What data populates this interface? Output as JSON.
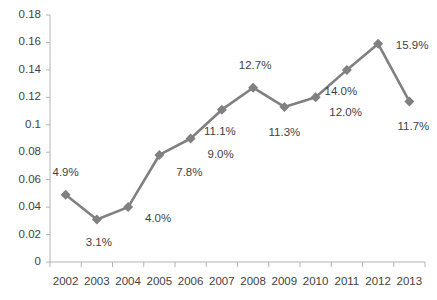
{
  "chart_data": {
    "type": "line",
    "title": "",
    "subtitle": "",
    "xlabel": "",
    "ylabel": "",
    "categories": [
      "2002",
      "2003",
      "2004",
      "2005",
      "2006",
      "2007",
      "2008",
      "2009",
      "2010",
      "2011",
      "2012",
      "2013"
    ],
    "values": [
      0.049,
      0.031,
      0.04,
      0.078,
      0.09,
      0.111,
      0.127,
      0.113,
      0.12,
      0.14,
      0.159,
      0.117
    ],
    "point_labels": [
      "4.9%",
      "3.1%",
      "4.0%",
      "7.8%",
      "9.0%",
      "11.1%",
      "12.7%",
      "11.3%",
      "12.0%",
      "14.0%",
      "15.9%",
      "11.7%"
    ],
    "ylim": [
      0,
      0.18
    ],
    "y_ticks": [
      "0",
      "0.02",
      "0.04",
      "0.06",
      "0.08",
      "0.1",
      "0.12",
      "0.14",
      "0.16",
      "0.18"
    ],
    "y_tick_values": [
      0,
      0.02,
      0.04,
      0.06,
      0.08,
      0.1,
      0.12,
      0.14,
      0.16,
      0.18
    ],
    "grid": false,
    "legend": false,
    "legend_position": "none",
    "series": [
      {
        "name": "",
        "color": "#808080",
        "marker": "diamond",
        "values": [
          0.049,
          0.031,
          0.04,
          0.078,
          0.09,
          0.111,
          0.127,
          0.113,
          0.12,
          0.14,
          0.159,
          0.117
        ]
      }
    ],
    "label_offsets": [
      {
        "dx": 0,
        "dy": -22
      },
      {
        "dx": 2,
        "dy": 24
      },
      {
        "dx": 30,
        "dy": 12
      },
      {
        "dx": 30,
        "dy": 18
      },
      {
        "dx": 30,
        "dy": 16
      },
      {
        "dx": -2,
        "dy": 22
      },
      {
        "dx": 2,
        "dy": -22
      },
      {
        "dx": 0,
        "dy": 26
      },
      {
        "dx": 30,
        "dy": 16
      },
      {
        "dx": -6,
        "dy": 22
      },
      {
        "dx": 34,
        "dy": 2
      },
      {
        "dx": 4,
        "dy": 26
      }
    ],
    "colors": {
      "line": "#808080",
      "marker": "#808080",
      "axis": "#b4b4b4",
      "tick_text": "#3f3f3f",
      "background": "#ffffff"
    },
    "plot_area": {
      "left": 50,
      "right": 425,
      "top": 15,
      "bottom": 262
    }
  }
}
